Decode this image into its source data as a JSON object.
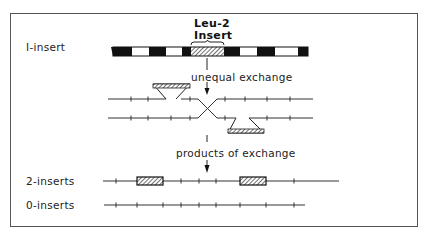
{
  "labels": {
    "one_insert": "I-insert",
    "leu2": "Leu-2",
    "insert": "Insert",
    "unequal_exchange": "unequal exchange",
    "products_of_exchange": "products of exchange",
    "two_inserts": "2-inserts",
    "zero_inserts": "0-inserts"
  },
  "colors": {
    "ink": "#1a1a1a",
    "line": "#444444",
    "frame": "#555555",
    "background": "#ffffff"
  },
  "diagram": {
    "bar": {
      "y": 47,
      "height": 9,
      "x_start": 113,
      "x_end": 308,
      "segments": [
        {
          "x": 113,
          "w": 19,
          "fill": "black"
        },
        {
          "x": 132,
          "w": 17,
          "fill": "white"
        },
        {
          "x": 149,
          "w": 17,
          "fill": "black"
        },
        {
          "x": 166,
          "w": 16,
          "fill": "white"
        },
        {
          "x": 182,
          "w": 9,
          "fill": "black"
        },
        {
          "x": 191,
          "w": 33,
          "fill": "hatch"
        },
        {
          "x": 224,
          "w": 16,
          "fill": "black"
        },
        {
          "x": 240,
          "w": 17,
          "fill": "white"
        },
        {
          "x": 257,
          "w": 18,
          "fill": "black"
        },
        {
          "x": 275,
          "w": 23,
          "fill": "white"
        },
        {
          "x": 298,
          "w": 10,
          "fill": "black"
        }
      ]
    },
    "exchange": {
      "top_line_y": 99,
      "bottom_line_y": 118,
      "top_left_ticks": [
        131,
        148,
        190
      ],
      "top_right_ticks": [
        225,
        245,
        267,
        290
      ],
      "bottom_left_ticks": [
        131,
        148,
        171,
        190
      ],
      "bottom_right_ticks": [
        225,
        267,
        290
      ]
    },
    "two_inserts": {
      "y": 181,
      "x_start": 103,
      "x_end": 339,
      "ticks": [
        116,
        181,
        199,
        216,
        294
      ],
      "inserts": [
        {
          "x": 137,
          "w": 26
        },
        {
          "x": 240,
          "w": 26
        }
      ]
    },
    "zero_inserts": {
      "y": 205,
      "x_start": 104,
      "x_end": 305,
      "ticks": [
        116,
        137,
        163,
        181,
        199,
        216,
        240,
        266,
        294
      ]
    }
  }
}
